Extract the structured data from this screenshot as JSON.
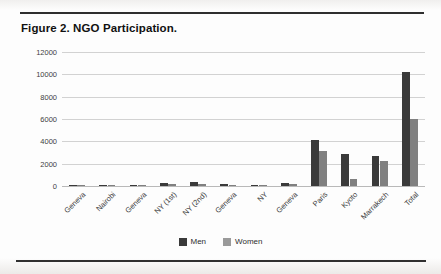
{
  "figure": {
    "title": "Figure 2.  NGO Participation."
  },
  "chart_data": {
    "type": "bar",
    "title": "Figure 2.  NGO Participation.",
    "xlabel": "",
    "ylabel": "",
    "ylim": [
      0,
      12000
    ],
    "ytick_labels": [
      "0",
      "2000",
      "4000",
      "6000",
      "8000",
      "10000",
      "12000"
    ],
    "ytick_values": [
      0,
      2000,
      4000,
      6000,
      8000,
      10000,
      12000
    ],
    "grid": true,
    "legend_position": "bottom-center",
    "categories": [
      "Geneva",
      "Nairobi",
      "Geneva",
      "NY (1st)",
      "NY (2nd)",
      "Geneva",
      "NY",
      "Geneva",
      "Paris",
      "Kyoto",
      "Marrakech",
      "Total"
    ],
    "series": [
      {
        "name": "Men",
        "color": "#3a3a3a",
        "values": [
          60,
          110,
          130,
          300,
          330,
          150,
          100,
          280,
          4100,
          2900,
          2700,
          10200
        ]
      },
      {
        "name": "Women",
        "color": "#808080",
        "values": [
          40,
          70,
          90,
          200,
          210,
          100,
          70,
          190,
          3100,
          600,
          2200,
          6000
        ]
      }
    ]
  }
}
